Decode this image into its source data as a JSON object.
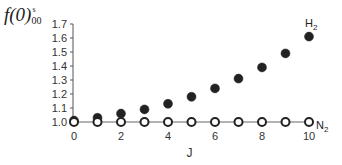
{
  "chart_data": {
    "type": "scatter",
    "title": "",
    "ylabel": "f(0)^s_00",
    "ylabel_parts": {
      "main": "f(0)",
      "superscript": "s",
      "subscript": "00"
    },
    "xlabel": "J",
    "xlim": [
      0,
      10
    ],
    "ylim": [
      1.0,
      1.7
    ],
    "x_ticks": [
      "0",
      "2",
      "4",
      "6",
      "8",
      "10"
    ],
    "y_ticks": [
      "1.0",
      "1.1",
      "1.2",
      "1.3",
      "1.4",
      "1.5",
      "1.6",
      "1.7"
    ],
    "grid": false,
    "legend_position": "inline labels at right end of series",
    "x": [
      0,
      1,
      2,
      3,
      4,
      5,
      6,
      7,
      8,
      9,
      10
    ],
    "series": [
      {
        "name": "H2",
        "label": "H₂",
        "marker": "filled-circle",
        "color": "#222222",
        "values": [
          1.01,
          1.03,
          1.06,
          1.09,
          1.13,
          1.18,
          1.24,
          1.31,
          1.39,
          1.49,
          1.61
        ]
      },
      {
        "name": "N2",
        "label": "N₂",
        "marker": "open-circle",
        "color": "#222222",
        "line": true,
        "values": [
          1.0,
          1.0,
          1.0,
          1.0,
          1.0,
          1.0,
          1.0,
          1.0,
          1.0,
          1.0,
          1.0
        ]
      }
    ]
  }
}
